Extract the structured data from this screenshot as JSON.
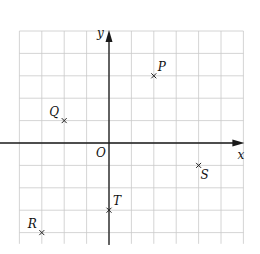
{
  "chart_data": {
    "type": "scatter",
    "title": "",
    "xlabel": "x",
    "ylabel": "y",
    "origin_label": "O",
    "xlim": [
      -4,
      6
    ],
    "ylim": [
      -4.5,
      5
    ],
    "grid": true,
    "grid_step": 1,
    "tick_labels": false,
    "points": [
      {
        "label": "P",
        "x": 2,
        "y": 3,
        "label_pos": "top-right"
      },
      {
        "label": "Q",
        "x": -2,
        "y": 1,
        "label_pos": "top-left"
      },
      {
        "label": "R",
        "x": -3,
        "y": -4,
        "label_pos": "top-left"
      },
      {
        "label": "S",
        "x": 4,
        "y": -1,
        "label_pos": "bottom-right"
      },
      {
        "label": "T",
        "x": 0,
        "y": -3,
        "label_pos": "top-right"
      }
    ],
    "marker": "cross"
  }
}
